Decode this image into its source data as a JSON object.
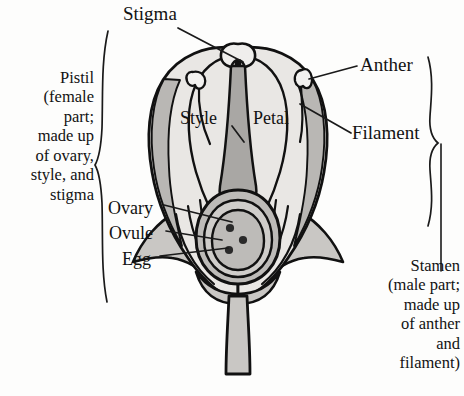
{
  "diagram": {
    "title_parts": {
      "stigma": "Stigma",
      "anther": "Anther",
      "filament": "Filament",
      "style": "Style",
      "petal": "Petal",
      "ovary": "Ovary",
      "ovule": "Ovule",
      "egg": "Egg"
    },
    "groups": {
      "pistil": "Pistil\n(female\npart;\nmade up\nof ovary,\nstyle, and\nstigma",
      "stamen": "Stamen\n(male part;\nmade up\nof anther\nand\nfilament)"
    },
    "colors": {
      "outline": "#111111",
      "petal_fill": "#e9e7e4",
      "petal_shade": "#b9b7b4",
      "style_fill": "#a9a7a4",
      "sepal_fill": "#c9c7c4",
      "ovary_fill": "#bdbbb8",
      "dot": "#2a2a2a",
      "background": "#fdfdfc",
      "leader": "#1a1a1a"
    }
  }
}
